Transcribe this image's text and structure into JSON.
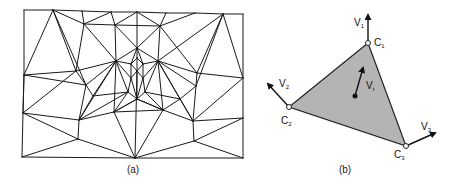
{
  "figure": {
    "panel_a": {
      "caption": "(a)",
      "caption_pos": [
        133,
        173
      ],
      "description": "triangle mesh",
      "nodes": [
        [
          24,
          10
        ],
        [
          53,
          10
        ],
        [
          82,
          11
        ],
        [
          111,
          12
        ],
        [
          137,
          12
        ],
        [
          166,
          13
        ],
        [
          195,
          13
        ],
        [
          223,
          14
        ],
        [
          243,
          14
        ],
        [
          84,
          24
        ],
        [
          115,
          25
        ],
        [
          160,
          26
        ],
        [
          137,
          48
        ],
        [
          116,
          61
        ],
        [
          158,
          61
        ],
        [
          137,
          58
        ],
        [
          137,
          71
        ],
        [
          131,
          64
        ],
        [
          143,
          64
        ],
        [
          131,
          78
        ],
        [
          143,
          78
        ],
        [
          76,
          71
        ],
        [
          197,
          73
        ],
        [
          86,
          85
        ],
        [
          196,
          86
        ],
        [
          93,
          96
        ],
        [
          128,
          92
        ],
        [
          137,
          99
        ],
        [
          145,
          92
        ],
        [
          180,
          99
        ],
        [
          24,
          75
        ],
        [
          243,
          78
        ],
        [
          23,
          113
        ],
        [
          79,
          120
        ],
        [
          114,
          112
        ],
        [
          163,
          110
        ],
        [
          193,
          121
        ],
        [
          243,
          118
        ],
        [
          78,
          139
        ],
        [
          194,
          141
        ],
        [
          22,
          157
        ],
        [
          135,
          158
        ],
        [
          243,
          158
        ]
      ],
      "edges": [
        [
          0,
          1
        ],
        [
          1,
          2
        ],
        [
          2,
          3
        ],
        [
          3,
          4
        ],
        [
          4,
          5
        ],
        [
          5,
          6
        ],
        [
          6,
          7
        ],
        [
          7,
          8
        ],
        [
          0,
          30
        ],
        [
          30,
          32
        ],
        [
          32,
          40
        ],
        [
          40,
          41
        ],
        [
          41,
          42
        ],
        [
          8,
          31
        ],
        [
          31,
          37
        ],
        [
          37,
          42
        ],
        [
          1,
          30
        ],
        [
          1,
          21
        ],
        [
          1,
          9
        ],
        [
          1,
          23
        ],
        [
          2,
          9
        ],
        [
          3,
          9
        ],
        [
          3,
          10
        ],
        [
          4,
          10
        ],
        [
          4,
          11
        ],
        [
          4,
          12
        ],
        [
          5,
          11
        ],
        [
          6,
          11
        ],
        [
          7,
          14
        ],
        [
          7,
          22
        ],
        [
          7,
          24
        ],
        [
          7,
          31
        ],
        [
          9,
          10
        ],
        [
          10,
          11
        ],
        [
          9,
          13
        ],
        [
          10,
          13
        ],
        [
          10,
          12
        ],
        [
          11,
          12
        ],
        [
          11,
          14
        ],
        [
          9,
          21
        ],
        [
          11,
          22
        ],
        [
          12,
          13
        ],
        [
          12,
          14
        ],
        [
          12,
          17
        ],
        [
          12,
          18
        ],
        [
          12,
          15
        ],
        [
          13,
          17
        ],
        [
          13,
          19
        ],
        [
          13,
          26
        ],
        [
          13,
          21
        ],
        [
          13,
          23
        ],
        [
          13,
          25
        ],
        [
          13,
          33
        ],
        [
          13,
          34
        ],
        [
          14,
          18
        ],
        [
          14,
          20
        ],
        [
          14,
          28
        ],
        [
          14,
          22
        ],
        [
          14,
          24
        ],
        [
          14,
          29
        ],
        [
          14,
          35
        ],
        [
          14,
          36
        ],
        [
          15,
          16
        ],
        [
          17,
          16
        ],
        [
          18,
          16
        ],
        [
          15,
          17
        ],
        [
          15,
          18
        ],
        [
          17,
          19
        ],
        [
          18,
          20
        ],
        [
          16,
          19
        ],
        [
          16,
          20
        ],
        [
          19,
          27
        ],
        [
          20,
          27
        ],
        [
          16,
          27
        ],
        [
          19,
          26
        ],
        [
          20,
          28
        ],
        [
          21,
          23
        ],
        [
          21,
          30
        ],
        [
          21,
          32
        ],
        [
          22,
          24
        ],
        [
          22,
          31
        ],
        [
          23,
          25
        ],
        [
          24,
          29
        ],
        [
          23,
          33
        ],
        [
          24,
          36
        ],
        [
          25,
          26
        ],
        [
          26,
          27
        ],
        [
          27,
          28
        ],
        [
          28,
          29
        ],
        [
          25,
          33
        ],
        [
          26,
          34
        ],
        [
          27,
          34
        ],
        [
          27,
          35
        ],
        [
          28,
          35
        ],
        [
          29,
          36
        ],
        [
          26,
          33
        ],
        [
          29,
          35
        ],
        [
          30,
          32
        ],
        [
          30,
          23
        ],
        [
          32,
          33
        ],
        [
          33,
          34
        ],
        [
          34,
          35
        ],
        [
          35,
          36
        ],
        [
          36,
          37
        ],
        [
          31,
          36
        ],
        [
          32,
          38
        ],
        [
          33,
          38
        ],
        [
          38,
          40
        ],
        [
          38,
          41
        ],
        [
          34,
          41
        ],
        [
          35,
          41
        ],
        [
          36,
          39
        ],
        [
          39,
          41
        ],
        [
          39,
          42
        ],
        [
          37,
          39
        ],
        [
          34,
          27
        ],
        [
          35,
          27
        ],
        [
          16,
          41
        ]
      ]
    },
    "panel_b": {
      "caption": "(b)",
      "caption_pos": [
        345,
        173
      ],
      "description": "single triangle with corner velocity vectors",
      "fill_color": "#b4b4b4",
      "corners": [
        {
          "label": "C",
          "sub": "1",
          "pos": [
            368,
            43
          ],
          "label_pos": [
            374,
            46
          ]
        },
        {
          "label": "C",
          "sub": "2",
          "pos": [
            289,
            107
          ],
          "label_pos": [
            281,
            124
          ]
        },
        {
          "label": "C",
          "sub": "3",
          "pos": [
            406,
            146
          ],
          "label_pos": [
            394,
            158
          ]
        }
      ],
      "vectors": [
        {
          "label": "V",
          "sub": "1",
          "from": [
            368,
            43
          ],
          "to": [
            368,
            15
          ],
          "label_pos": [
            354,
            26
          ]
        },
        {
          "label": "V",
          "sub": "2",
          "from": [
            289,
            107
          ],
          "to": [
            268,
            84
          ],
          "label_pos": [
            279,
            87
          ]
        },
        {
          "label": "V",
          "sub": "3",
          "from": [
            406,
            146
          ],
          "to": [
            435,
            133
          ],
          "label_pos": [
            421,
            130
          ]
        },
        {
          "label": "V",
          "sub": "t",
          "from": [
            355,
            96
          ],
          "to": [
            363,
            68
          ],
          "label_pos": [
            366,
            89
          ]
        }
      ]
    }
  }
}
